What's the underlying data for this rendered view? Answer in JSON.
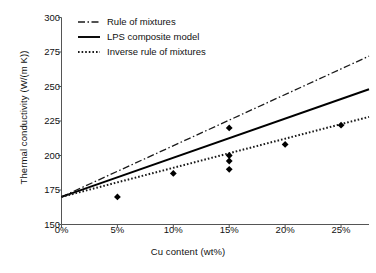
{
  "chart_data": {
    "type": "line",
    "title": "",
    "xlabel": "Cu content (wt%)",
    "ylabel": "Thermal conductivity (W/(m K))",
    "xlim": [
      0,
      27.5
    ],
    "ylim": [
      150,
      300
    ],
    "xticks": [
      "0%",
      "5%",
      "10%",
      "15%",
      "20%",
      "25%"
    ],
    "xtick_values": [
      0,
      5,
      10,
      15,
      20,
      25
    ],
    "yticks": [
      "150",
      "175",
      "200",
      "225",
      "250",
      "275",
      "300"
    ],
    "ytick_values": [
      150,
      175,
      200,
      225,
      250,
      275,
      300
    ],
    "grid": false,
    "legend_position": "top-left",
    "series": [
      {
        "name": "Rule of mixtures",
        "style": "dash-dot",
        "color": "#1a1a1a",
        "x": [
          0,
          27.5
        ],
        "values": [
          170,
          272
        ]
      },
      {
        "name": "LPS composite model",
        "style": "solid",
        "color": "#000000",
        "x": [
          0,
          27.5
        ],
        "values": [
          170,
          248
        ]
      },
      {
        "name": "Inverse rule of mixtures",
        "style": "dotted",
        "color": "#1a1a1a",
        "x": [
          0,
          27.5
        ],
        "values": [
          170,
          228
        ]
      }
    ],
    "scatter": {
      "name": "Measured data",
      "marker": "diamond",
      "color": "#000000",
      "points": [
        {
          "x": 5,
          "y": 170
        },
        {
          "x": 10,
          "y": 187
        },
        {
          "x": 15,
          "y": 220
        },
        {
          "x": 15,
          "y": 200
        },
        {
          "x": 15,
          "y": 196
        },
        {
          "x": 15,
          "y": 190
        },
        {
          "x": 20,
          "y": 208
        },
        {
          "x": 25,
          "y": 222
        }
      ]
    }
  },
  "legend": {
    "items": [
      {
        "label": "Rule of mixtures"
      },
      {
        "label": "LPS composite model"
      },
      {
        "label": "Inverse rule of mixtures"
      }
    ]
  }
}
